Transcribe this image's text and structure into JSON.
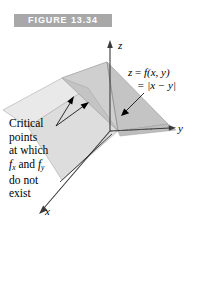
{
  "figure": {
    "banner_label": "FIGURE 13.34",
    "banner_bg": "#a8a8a8",
    "banner_text_color": "#ffffff",
    "background": "#ffffff"
  },
  "axes": {
    "z_label": "z",
    "y_label": "y",
    "x_label": "x",
    "axis_color": "#444444"
  },
  "equation": {
    "line1_lhs": "z",
    "line1_eq": " = ",
    "line1_rhs": "f(x, y)",
    "line2": "= |x − y|",
    "full": "z = f(x, y) = |x − y|"
  },
  "callout": {
    "line1": "Critical",
    "line2": "points",
    "line3": "at which",
    "line4_f": "f",
    "line4_sub1": "x",
    "line4_and": " and ",
    "line4_f2": "f",
    "line4_sub2": "y",
    "line5": "do not",
    "line6": "exist",
    "full": "Critical points at which fx and fy do not exist"
  },
  "surface": {
    "description": "V-shaped surface z = |x - y| formed by two half-planes meeting along the line x = y",
    "left_plane_fill": "#e4e4e4",
    "right_plane_fill": "#c2c2c2",
    "front_plane_fill": "#d6d6d6",
    "edge_color": "#9a9a9a"
  }
}
